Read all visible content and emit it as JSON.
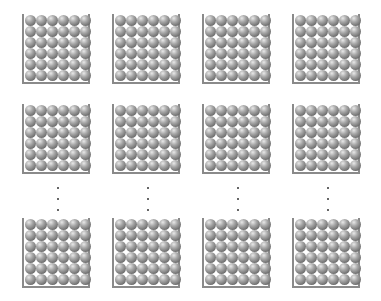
{
  "diagram": {
    "columns": 4,
    "rows_shown": 3,
    "balls_per_row": 6,
    "balls_per_column": 6,
    "column_x": [
      22,
      112,
      202,
      292
    ],
    "row_y": [
      14,
      104,
      218
    ],
    "ellipsis": {
      "y": [
        187,
        198,
        209
      ],
      "x": [
        57,
        147,
        237,
        327
      ]
    },
    "colors": {
      "wall": "#8a8a8a",
      "ball": "#8c8c8c",
      "dot": "#333333"
    }
  }
}
